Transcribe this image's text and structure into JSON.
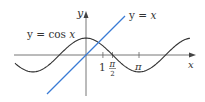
{
  "figure": {
    "type": "function-graph",
    "axes": {
      "x_label": "x",
      "y_label": "y",
      "origin_px": [
        86,
        55
      ],
      "px_per_unit": 16.9
    },
    "curves": [
      {
        "name": "cosine",
        "label_left": "y = cos ",
        "label_var": "x",
        "color": "#333333",
        "expr": "cos x"
      },
      {
        "name": "identity",
        "label_left": "y = ",
        "label_var": "x",
        "color": "#3a7bd5",
        "expr": "x"
      }
    ],
    "ticks": [
      {
        "label": "1",
        "value": 1
      },
      {
        "label": "π",
        "sublabel": "2",
        "value": 1.5708,
        "is_fraction": true
      },
      {
        "label": "π",
        "value": 3.14159
      }
    ],
    "colors": {
      "axis": "#555555",
      "cos": "#333333",
      "line": "#3a7bd5"
    }
  }
}
